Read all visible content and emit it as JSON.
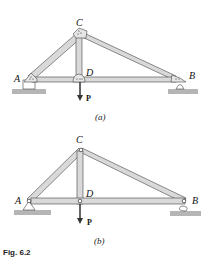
{
  "figure": {
    "caption": "Fig. 6.2",
    "colors": {
      "member_fill": "#d9d9d9",
      "member_stroke": "#444444",
      "ground": "#b5b5b5"
    }
  },
  "diagram_a": {
    "label": "(a)",
    "joints": {
      "A": "A",
      "B": "B",
      "C": "C",
      "D": "D"
    },
    "load": "P",
    "connection": "gusset plates"
  },
  "diagram_b": {
    "label": "(b)",
    "joints": {
      "A": "A",
      "B": "B",
      "C": "C",
      "D": "D"
    },
    "load": "P",
    "connection": "pins"
  }
}
